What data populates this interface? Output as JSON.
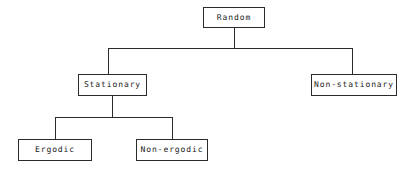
{
  "diagram": {
    "type": "tree",
    "background_color": "#ffffff",
    "line_color": "#2b2b2b",
    "text_color": "#1a1a1a",
    "nodes": [
      {
        "id": "random",
        "label": "Random",
        "level": 0
      },
      {
        "id": "stationary",
        "label": "Stationary",
        "level": 1
      },
      {
        "id": "nonstationary",
        "label": "Non-stationary",
        "level": 1
      },
      {
        "id": "ergodic",
        "label": "Ergodic",
        "level": 2
      },
      {
        "id": "nonergodic",
        "label": "Non-ergodic",
        "level": 2
      }
    ],
    "edges": [
      {
        "from": "random",
        "to": "stationary"
      },
      {
        "from": "random",
        "to": "nonstationary"
      },
      {
        "from": "stationary",
        "to": "ergodic"
      },
      {
        "from": "stationary",
        "to": "nonergodic"
      }
    ]
  }
}
